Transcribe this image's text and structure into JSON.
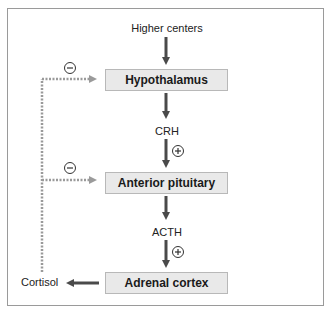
{
  "diagram": {
    "nodes": {
      "top_label": "Higher centers",
      "hypothalamus": "Hypothalamus",
      "crh": "CRH",
      "anterior_pituitary": "Anterior pituitary",
      "acth": "ACTH",
      "adrenal_cortex": "Adrenal cortex",
      "cortisol": "Cortisol"
    },
    "signs": {
      "stimulate": "+",
      "inhibit": "−"
    },
    "colors": {
      "solid_arrow": "#4a4a4a",
      "feedback_arrow": "#9a9a9a",
      "box_fill": "#e9e9e9",
      "frame": "#9a9a9a"
    }
  }
}
